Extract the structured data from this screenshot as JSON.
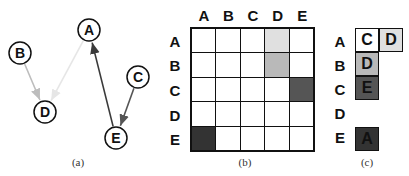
{
  "panel_a": {
    "caption": "(a)",
    "nodes": [
      {
        "id": "A",
        "x": 89,
        "y": 30
      },
      {
        "id": "B",
        "x": 20,
        "y": 53
      },
      {
        "id": "C",
        "x": 138,
        "y": 77
      },
      {
        "id": "D",
        "x": 45,
        "y": 112
      },
      {
        "id": "E",
        "x": 116,
        "y": 138
      }
    ],
    "edges": [
      {
        "from": "A",
        "to": "D",
        "color": "#e6e6e6"
      },
      {
        "from": "B",
        "to": "D",
        "color": "#bdbdbd"
      },
      {
        "from": "C",
        "to": "E",
        "color": "#555555"
      },
      {
        "from": "E",
        "to": "A",
        "color": "#3a3a3a"
      }
    ]
  },
  "panel_b": {
    "caption": "(b)",
    "col_headers": [
      "A",
      "B",
      "C",
      "D",
      "E"
    ],
    "row_headers": [
      "A",
      "B",
      "C",
      "D",
      "E"
    ],
    "cells": [
      [
        "#ffffff",
        "#ffffff",
        "#ffffff",
        "#e0e0e0",
        "#ffffff"
      ],
      [
        "#ffffff",
        "#ffffff",
        "#ffffff",
        "#b9b9b9",
        "#ffffff"
      ],
      [
        "#ffffff",
        "#ffffff",
        "#ffffff",
        "#ffffff",
        "#555555"
      ],
      [
        "#ffffff",
        "#ffffff",
        "#ffffff",
        "#ffffff",
        "#ffffff"
      ],
      [
        "#333333",
        "#ffffff",
        "#ffffff",
        "#ffffff",
        "#ffffff"
      ]
    ]
  },
  "panel_c": {
    "caption": "(c)",
    "row_headers": [
      "A",
      "B",
      "C",
      "D",
      "E"
    ],
    "lists": [
      [
        {
          "label": "C",
          "color": "#ffffff"
        },
        {
          "label": "D",
          "color": "#e0e0e0"
        }
      ],
      [
        {
          "label": "D",
          "color": "#b9b9b9"
        }
      ],
      [
        {
          "label": "E",
          "color": "#555555"
        }
      ],
      [],
      [
        {
          "label": "A",
          "color": "#333333"
        }
      ]
    ]
  }
}
